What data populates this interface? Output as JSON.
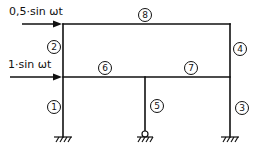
{
  "diagram": {
    "type": "structural-frame",
    "loads": [
      {
        "id": "load-top",
        "label": "0,5·sin ωt",
        "level": "top-beam"
      },
      {
        "id": "load-mid",
        "label": "1·sin ωt",
        "level": "middle-beam"
      }
    ],
    "members": [
      {
        "n": "1",
        "label": "①",
        "kind": "column",
        "position": "left-lower"
      },
      {
        "n": "2",
        "label": "②",
        "kind": "column",
        "position": "left-upper"
      },
      {
        "n": "3",
        "label": "③",
        "kind": "column",
        "position": "right-lower"
      },
      {
        "n": "4",
        "label": "④",
        "kind": "column",
        "position": "right-upper"
      },
      {
        "n": "5",
        "label": "⑤",
        "kind": "column",
        "position": "middle-lower"
      },
      {
        "n": "6",
        "label": "⑥",
        "kind": "beam",
        "position": "middle-left"
      },
      {
        "n": "7",
        "label": "⑦",
        "kind": "beam",
        "position": "middle-right"
      },
      {
        "n": "8",
        "label": "⑧",
        "kind": "beam",
        "position": "top"
      }
    ],
    "supports": [
      {
        "id": "support-left",
        "kind": "fixed"
      },
      {
        "id": "support-middle",
        "kind": "pinned"
      },
      {
        "id": "support-right",
        "kind": "fixed"
      }
    ],
    "colors": {
      "stroke": "#111111",
      "background": "#ffffff"
    }
  }
}
